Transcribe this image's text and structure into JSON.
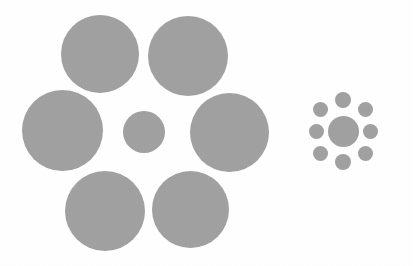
{
  "image": {
    "title": "Ebbinghaus illusion",
    "subject": "size-contrast visual illusion",
    "width": 413,
    "height": 266,
    "background_color": "#ffffff",
    "circle_color": "#a0a0a0",
    "circle_color_secondary": "#9c9c9c"
  },
  "figures": [
    {
      "id": "left-configuration",
      "name": "small-center-with-large-inducers",
      "center_circle": {
        "name": "center-target-circle-left",
        "cx": 144,
        "cy": 132,
        "diameter": 42,
        "color": "#a0a0a0"
      },
      "inducer_count": 6,
      "inducers": [
        {
          "name": "inducer-top-left",
          "cx": 100,
          "cy": 54,
          "diameter": 78,
          "color": "#a0a0a0"
        },
        {
          "name": "inducer-top-right",
          "cx": 188,
          "cy": 56,
          "diameter": 80,
          "color": "#a0a0a0"
        },
        {
          "name": "inducer-left",
          "cx": 62,
          "cy": 130,
          "diameter": 81,
          "color": "#a0a0a0"
        },
        {
          "name": "inducer-right",
          "cx": 229,
          "cy": 132,
          "diameter": 79,
          "color": "#a0a0a0"
        },
        {
          "name": "inducer-bottom-left",
          "cx": 105,
          "cy": 211,
          "diameter": 80,
          "color": "#a0a0a0"
        },
        {
          "name": "inducer-bottom-right",
          "cx": 190,
          "cy": 209,
          "diameter": 77,
          "color": "#a0a0a0"
        }
      ]
    },
    {
      "id": "right-configuration",
      "name": "large-center-with-small-inducers",
      "center_circle": {
        "name": "center-target-circle-right",
        "cx": 343,
        "cy": 131,
        "diameter": 31,
        "color": "#a0a0a0"
      },
      "inducer_count": 8,
      "inducers": [
        {
          "name": "inducer-n",
          "cx": 343,
          "cy": 100,
          "diameter": 16,
          "color": "#a0a0a0"
        },
        {
          "name": "inducer-ne",
          "cx": 365,
          "cy": 109,
          "diameter": 15,
          "color": "#a0a0a0"
        },
        {
          "name": "inducer-e",
          "cx": 370,
          "cy": 131,
          "diameter": 15,
          "color": "#a0a0a0"
        },
        {
          "name": "inducer-se",
          "cx": 365,
          "cy": 153,
          "diameter": 15,
          "color": "#a0a0a0"
        },
        {
          "name": "inducer-s",
          "cx": 343,
          "cy": 162,
          "diameter": 16,
          "color": "#a0a0a0"
        },
        {
          "name": "inducer-sw",
          "cx": 320,
          "cy": 153,
          "diameter": 15,
          "color": "#a0a0a0"
        },
        {
          "name": "inducer-w",
          "cx": 316,
          "cy": 131,
          "diameter": 15,
          "color": "#a0a0a0"
        },
        {
          "name": "inducer-nw",
          "cx": 320,
          "cy": 109,
          "diameter": 15,
          "color": "#a0a0a0"
        }
      ]
    }
  ]
}
